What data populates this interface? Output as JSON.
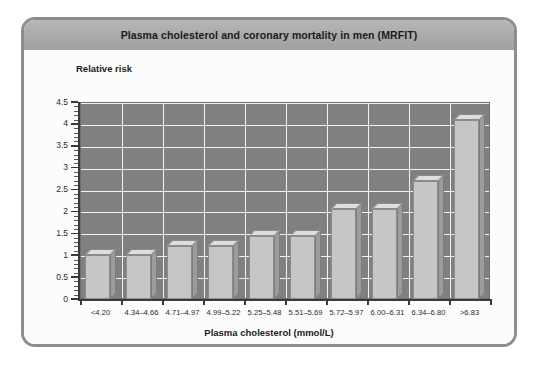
{
  "panel": {
    "title": "Plasma cholesterol and coronary mortality in men (MRFIT)"
  },
  "chart_data": {
    "type": "bar",
    "title": "Plasma cholesterol and coronary mortality in men (MRFIT)",
    "xlabel": "Plasma cholesterol  (mmol/L)",
    "ylabel": "Relative risk",
    "categories": [
      "<4.20",
      "4.34–4.66",
      "4.71–4.97",
      "4.99–5.22",
      "5.25–5.48",
      "5.51–5.69",
      "5.72–5.97",
      "6.00–6.31",
      "6.34–6.80",
      ">6.83"
    ],
    "values": [
      1.0,
      1.0,
      1.2,
      1.2,
      1.45,
      1.45,
      2.05,
      2.05,
      2.7,
      4.1
    ],
    "ylim": [
      0,
      4.5
    ],
    "ytick_labels": [
      "0",
      "0.5",
      "1",
      "1.5",
      "2",
      "2.5",
      "3",
      "3.5",
      "4",
      "4.5"
    ],
    "ytick_values": [
      0,
      0.5,
      1,
      1.5,
      2,
      2.5,
      3,
      3.5,
      4,
      4.5
    ],
    "grid": true,
    "legend": "none",
    "colors": {
      "plot_background": "#808080",
      "gridline": "#f2f2f2",
      "bar_front": "#c6c6c6",
      "bar_side": "#9c9c9c",
      "bar_top": "#dedede",
      "title_bar": "#a8a8a8",
      "panel_border": "#8d8d8d"
    }
  }
}
